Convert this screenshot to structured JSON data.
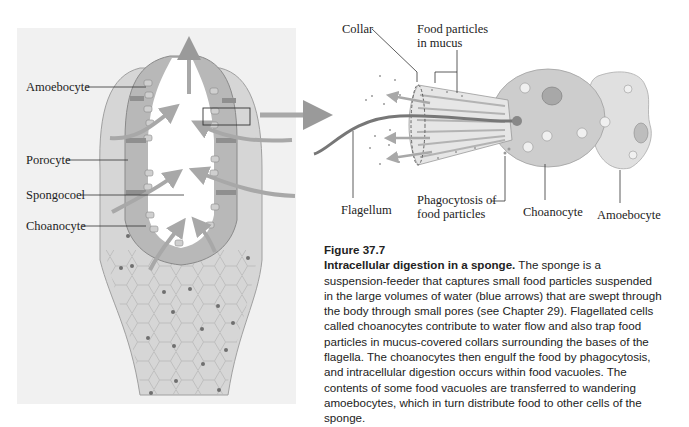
{
  "figure": {
    "number": "Figure 37.7",
    "title": "Intracellular digestion in a sponge.",
    "body": " The sponge is a suspension-feeder that captures small food particles suspended in the large volumes of water (blue arrows) that are swept through the body through small pores (see Chapter 29). Flagellated cells called choanocytes contribute to water flow and also trap food particles in mucus-covered collars surrounding the bases of the flagella. The choanocytes then engulf the food by phagocytosis, and intracellular digestion occurs within food vacuoles. The contents of some food vacuoles are transferred to wandering amoebocytes, which in turn distribute food to other cells of the sponge."
  },
  "sponge_labels": {
    "amoebocyte": "Amoebocyte",
    "porocyte": "Porocyte",
    "spongocoel": "Spongocoel",
    "choanocyte": "Choanocyte"
  },
  "cell_labels": {
    "collar": "Collar",
    "food_particles_1": "Food particles",
    "food_particles_2": "in mucus",
    "flagellum": "Flagellum",
    "phagocytosis_1": "Phagocytosis of",
    "phagocytosis_2": "food particles",
    "choanocyte": "Choanocyte",
    "amoebocyte": "Amoebocyte"
  },
  "colors": {
    "panel_bg": "#f1f1f1",
    "arrow": "#9a9a9a",
    "tissue": "#b8b8b8",
    "cell_fill": "#d2d2d2"
  }
}
